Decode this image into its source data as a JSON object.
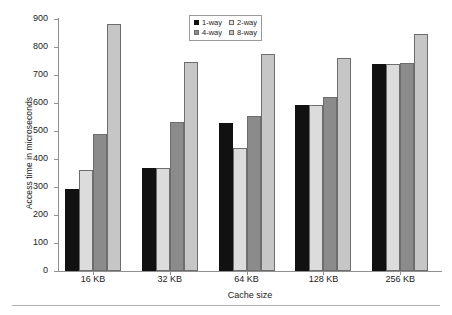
{
  "chart_data": {
    "type": "bar",
    "title": "",
    "xlabel": "Cache size",
    "ylabel": "Access time in microseconds",
    "categories": [
      "16 KB",
      "32 KB",
      "64 KB",
      "128 KB",
      "256 KB"
    ],
    "series": [
      {
        "name": "1-way",
        "color": "#111111",
        "values": [
          294,
          368,
          530,
          592,
          738
        ]
      },
      {
        "name": "2-way",
        "color": "#dcdcdc",
        "values": [
          360,
          368,
          440,
          592,
          738
        ]
      },
      {
        "name": "4-way",
        "color": "#8b8b8b",
        "values": [
          489,
          532,
          553,
          620,
          743
        ]
      },
      {
        "name": "8-way",
        "color": "#c6c6c6",
        "values": [
          882,
          745,
          774,
          760,
          848
        ]
      }
    ],
    "ylim": [
      0,
      900
    ],
    "yticks": [
      0,
      100,
      200,
      300,
      400,
      500,
      600,
      700,
      800,
      900
    ],
    "ytick_labels": [
      "0",
      "100",
      "200",
      "300",
      "400",
      "500",
      "600",
      "700",
      "800",
      "900"
    ],
    "grid": false,
    "legend_position": "top-center",
    "legend_entries": [
      "1-way",
      "2-way",
      "4-way",
      "8-way"
    ]
  },
  "axes": {
    "y_title": "Access time in microseconds",
    "x_title": "Cache size"
  }
}
